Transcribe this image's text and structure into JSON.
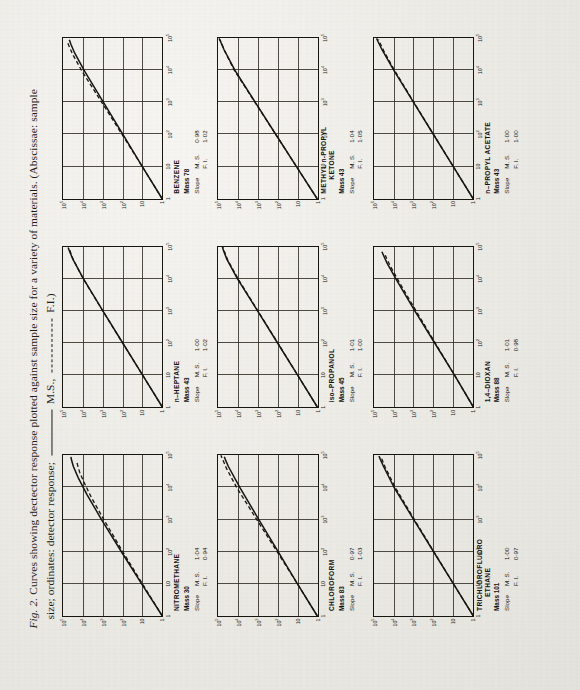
{
  "caption": {
    "fig_label": "Fig. 2.",
    "line1": "Curves showing dectector response plotted against sample size for a variety of materials. (Abscissae: sample",
    "line2_a": "size; ordinates: detector response;",
    "legend_ms": "M.S.,",
    "legend_fi": "F.I.)"
  },
  "labels": {
    "slope_word": "Slope",
    "ms_key": "M. S.",
    "fi_key": "F. I.",
    "mass_word": "Mass"
  },
  "axes": {
    "y_ticks": [
      "1",
      "10",
      "10²",
      "10³",
      "10⁴",
      "10⁵"
    ],
    "x_ticks": [
      "1",
      "10",
      "10²",
      "10³",
      "10⁴",
      "10⁵"
    ]
  },
  "chart_data": [
    {
      "type": "line",
      "title": "NITROMETHANE",
      "title_prefix": "",
      "mass": "30",
      "slope_ms": "1·04",
      "slope_fi": "0·94",
      "xlabel": "sample size",
      "ylabel": "detector response",
      "xlim": [
        1,
        100000
      ],
      "ylim": [
        1,
        100000
      ],
      "grid": true,
      "series": [
        {
          "name": "M.S.",
          "style": "solid",
          "x": [
            1,
            10,
            100,
            1000,
            6000,
            20000,
            45000,
            70000,
            90000
          ],
          "y": [
            1,
            11,
            115,
            1150,
            6200,
            17000,
            30000,
            37000,
            40000
          ]
        },
        {
          "name": "F.I.",
          "style": "dashed",
          "x": [
            1,
            10,
            100,
            1000,
            5000,
            15000,
            30000,
            50000,
            62000
          ],
          "y": [
            1,
            10,
            98,
            880,
            3800,
            9000,
            14500,
            18500,
            20000
          ]
        }
      ]
    },
    {
      "type": "line",
      "title": "HEPTANE",
      "title_prefix": "n–",
      "mass": "43",
      "slope_ms": "1·00",
      "slope_fi": "1·02",
      "xlabel": "sample size",
      "ylabel": "detector response",
      "xlim": [
        1,
        100000
      ],
      "ylim": [
        1,
        100000
      ],
      "grid": true,
      "series": [
        {
          "name": "M.S.",
          "style": "solid",
          "x": [
            1,
            10,
            100,
            1000,
            10000,
            40000,
            70000,
            92000
          ],
          "y": [
            1,
            10,
            100,
            1000,
            9600,
            32000,
            47000,
            55000
          ]
        },
        {
          "name": "F.I.",
          "style": "dashed",
          "x": [
            1,
            10,
            100,
            1000,
            10000,
            38000,
            65000,
            88000
          ],
          "y": [
            1,
            10,
            102,
            1020,
            9800,
            30000,
            42000,
            48000
          ]
        }
      ]
    },
    {
      "type": "line",
      "title": "BENZENE",
      "title_prefix": "",
      "mass": "78",
      "slope_ms": "0·98",
      "slope_fi": "1·02",
      "xlabel": "sample size",
      "ylabel": "detector response",
      "xlim": [
        1,
        100000
      ],
      "ylim": [
        1,
        100000
      ],
      "grid": true,
      "series": [
        {
          "name": "M.S.",
          "style": "solid",
          "x": [
            1,
            10,
            100,
            1000,
            9000,
            35000,
            65000,
            90000
          ],
          "y": [
            1,
            10,
            95,
            900,
            7800,
            26000,
            40000,
            48000
          ]
        },
        {
          "name": "F.I.",
          "style": "dashed",
          "x": [
            1,
            10,
            100,
            1000,
            9000,
            32000,
            58000,
            80000
          ],
          "y": [
            1,
            10,
            105,
            1100,
            10500,
            33000,
            50000,
            62000
          ]
        }
      ]
    },
    {
      "type": "line",
      "title": "CHLOROFORM",
      "title_prefix": "",
      "mass": "83",
      "slope_ms": "0·97",
      "slope_fi": "1·03",
      "xlabel": "sample size",
      "ylabel": "detector response",
      "xlim": [
        1,
        100000
      ],
      "ylim": [
        1,
        100000
      ],
      "grid": true,
      "series": [
        {
          "name": "M.S.",
          "style": "solid",
          "x": [
            1,
            10,
            100,
            1000,
            10000,
            45000,
            72000,
            90000
          ],
          "y": [
            1,
            10,
            94,
            880,
            8000,
            30000,
            42000,
            48000
          ]
        },
        {
          "name": "F.I.",
          "style": "dashed",
          "x": [
            1,
            10,
            100,
            1000,
            10000,
            40000,
            75000,
            100000
          ],
          "y": [
            1,
            10,
            106,
            1120,
            11500,
            38000,
            58000,
            72000
          ]
        }
      ]
    },
    {
      "type": "line",
      "title": "PROPANOL",
      "title_prefix": "iso–",
      "mass": "45",
      "slope_ms": "1·01",
      "slope_fi": "1·00",
      "xlabel": "sample size",
      "ylabel": "detector response",
      "xlim": [
        1,
        100000
      ],
      "ylim": [
        1,
        100000
      ],
      "grid": true,
      "series": [
        {
          "name": "M.S.",
          "style": "solid",
          "x": [
            1,
            10,
            100,
            1000,
            10000,
            40000,
            72000,
            95000
          ],
          "y": [
            1,
            10,
            102,
            1040,
            10800,
            36000,
            52000,
            60000
          ]
        },
        {
          "name": "F.I.",
          "style": "dashed",
          "x": [
            1,
            10,
            100,
            1000,
            10000,
            40000,
            70000,
            92000
          ],
          "y": [
            1,
            10,
            100,
            1000,
            10000,
            34000,
            48000,
            55000
          ]
        }
      ]
    },
    {
      "type": "line",
      "title": "METHYL n-PROPYL KETONE",
      "title_prefix": "",
      "mass": "43",
      "slope_ms": "1·04",
      "slope_fi": "1·05",
      "xlabel": "sample size",
      "ylabel": "detector response",
      "xlim": [
        1,
        100000
      ],
      "ylim": [
        1,
        100000
      ],
      "grid": true,
      "series": [
        {
          "name": "M.S.",
          "style": "solid",
          "x": [
            1,
            10,
            100,
            1000,
            10000,
            45000,
            78000,
            100000
          ],
          "y": [
            1,
            11,
            120,
            1300,
            14000,
            50000,
            74000,
            88000
          ]
        },
        {
          "name": "F.I.",
          "style": "dashed",
          "x": [
            1,
            10,
            100,
            1000,
            10000,
            42000,
            70000,
            90000
          ],
          "y": [
            1,
            11,
            122,
            1350,
            15000,
            48000,
            66000,
            78000
          ]
        }
      ]
    },
    {
      "type": "line",
      "title": "TRICHLOROFLUORO ETHANE",
      "title_prefix": "",
      "title_line1": "TRICHLOROFLUORO",
      "title_line2": "ETHANE",
      "mass": "101",
      "slope_ms": "1·00",
      "slope_fi": "0·97",
      "xlabel": "sample size",
      "ylabel": "detector response",
      "xlim": [
        1,
        100000
      ],
      "ylim": [
        1,
        100000
      ],
      "grid": true,
      "series": [
        {
          "name": "M.S.",
          "style": "solid",
          "x": [
            1,
            10,
            100,
            1000,
            10000,
            45000,
            75000,
            95000
          ],
          "y": [
            1,
            10,
            100,
            1000,
            9800,
            33000,
            48000,
            56000
          ]
        },
        {
          "name": "F.I.",
          "style": "dashed",
          "x": [
            1,
            10,
            100,
            1000,
            10000,
            42000,
            70000,
            88000
          ],
          "y": [
            1,
            10,
            96,
            920,
            8500,
            27000,
            38000,
            44000
          ]
        }
      ]
    },
    {
      "type": "line",
      "title": "DIOXAN",
      "title_prefix": "1,4–",
      "mass": "88",
      "slope_ms": "1·01",
      "slope_fi": "0·98",
      "xlabel": "sample size",
      "ylabel": "detector response",
      "xlim": [
        1,
        100000
      ],
      "ylim": [
        1,
        100000
      ],
      "grid": true,
      "series": [
        {
          "name": "M.S.",
          "style": "solid",
          "x": [
            1,
            10,
            100,
            1000,
            9000,
            30000,
            52000,
            68000
          ],
          "y": [
            1,
            9,
            90,
            900,
            7400,
            22000,
            33000,
            40000
          ]
        },
        {
          "name": "F.I.",
          "style": "dashed",
          "x": [
            1,
            10,
            100,
            1000,
            8000,
            25000,
            42000,
            56000
          ],
          "y": [
            1,
            9,
            84,
            780,
            5600,
            15500,
            23000,
            28000
          ]
        }
      ]
    },
    {
      "type": "line",
      "title": "PROPYL ACETATE",
      "title_prefix": "n–",
      "mass": "43",
      "slope_ms": "1·00",
      "slope_fi": "1·00",
      "xlabel": "sample size",
      "ylabel": "detector response",
      "xlim": [
        1,
        100000
      ],
      "ylim": [
        1,
        100000
      ],
      "grid": true,
      "series": [
        {
          "name": "M.S.",
          "style": "solid",
          "x": [
            1,
            10,
            100,
            1000,
            10000,
            45000,
            78000,
            100000
          ],
          "y": [
            1,
            10,
            100,
            1000,
            10000,
            40000,
            62000,
            74000
          ]
        },
        {
          "name": "F.I.",
          "style": "dashed",
          "x": [
            1,
            10,
            100,
            1000,
            10000,
            42000,
            72000,
            92000
          ],
          "y": [
            1,
            10,
            98,
            960,
            9200,
            33000,
            50000,
            60000
          ]
        }
      ]
    }
  ]
}
